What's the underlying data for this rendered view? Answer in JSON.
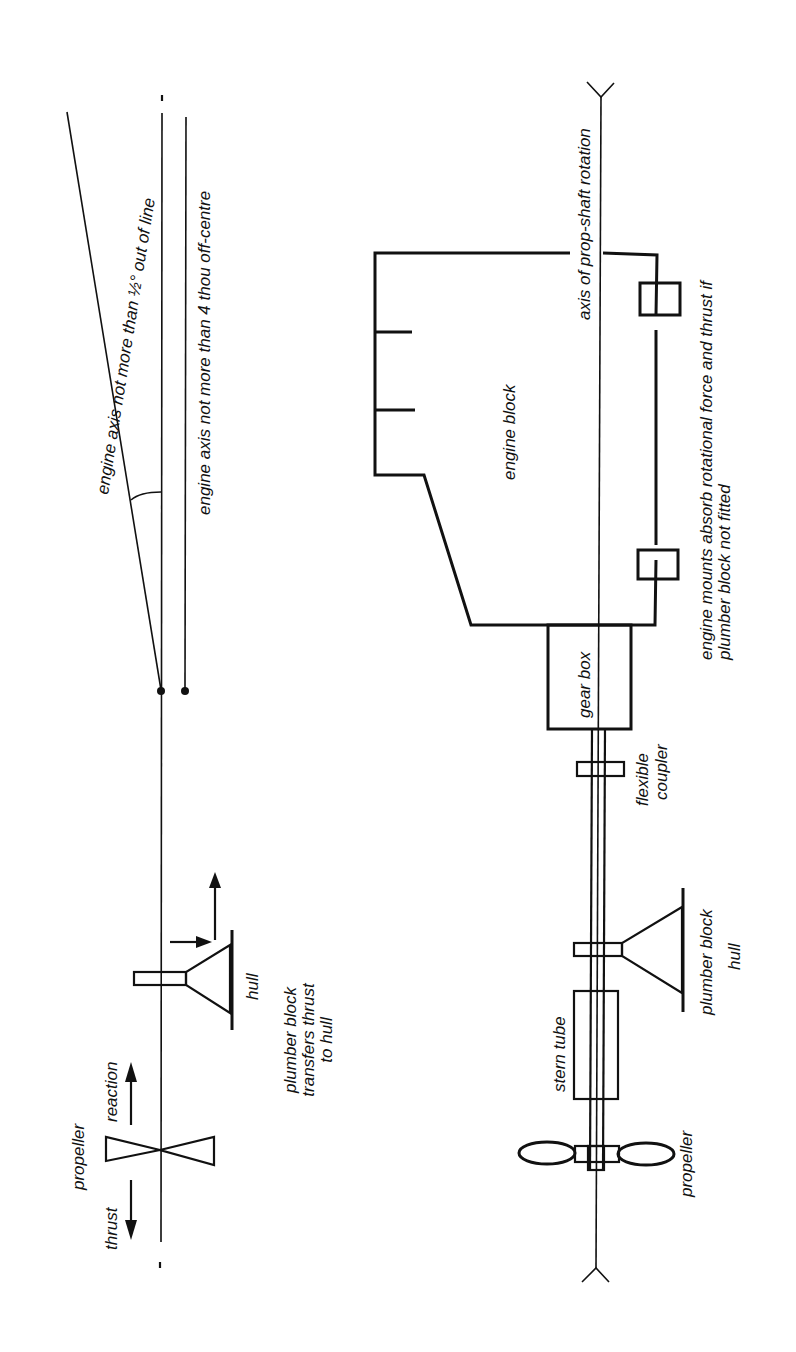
{
  "diagram": {
    "orientation": "rotated 90 degrees counter-clockwise",
    "colors": {
      "ink": "#111111",
      "background": "#ffffff"
    },
    "alignment_diagram": {
      "labels": {
        "angle_tolerance": "engine axis not more than ½° out of line",
        "offset_tolerance": "engine axis not more than 4 thou off-centre",
        "propeller": "propeller",
        "thrust": "thrust",
        "reaction": "reaction",
        "hull": "hull",
        "plumber_block_line1": "plumber block",
        "plumber_block_line2": "transfers thrust",
        "plumber_block_line3": "to hull"
      }
    },
    "drivetrain_diagram": {
      "labels": {
        "axis": "axis of prop-shaft rotation",
        "engine_block": "engine block",
        "engine_mounts_line1": "engine mounts absorb rotational force and thrust if",
        "engine_mounts_line2": "plumber block not fitted",
        "gear_box": "gear box",
        "flexible_coupler_line1": "flexible",
        "flexible_coupler_line2": "coupler",
        "plumber_block": "plumber block",
        "hull": "hull",
        "stern_tube": "stern tube",
        "propeller": "propeller"
      }
    }
  }
}
